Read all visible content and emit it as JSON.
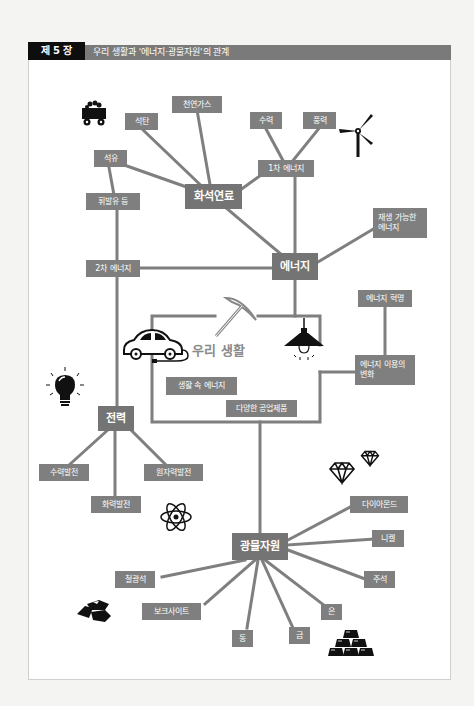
{
  "header": {
    "chapter": "제 5 장",
    "title": "우리 생활과 '에너지·광물자원'의 관계"
  },
  "colors": {
    "box": "#7f7f7f",
    "line": "#7f7f7f",
    "header_dark": "#0e0e0e",
    "header_gray": "#7a7a7a",
    "icon": "#111111"
  },
  "center": {
    "label": "우리 생활"
  },
  "nodes": {
    "energy": "에너지",
    "fossil_fuel": "화석연료",
    "primary_energy": "1차 에너지",
    "secondary_energy": "2차 에너지",
    "renewable_energy": "재생 가능한 에너지",
    "coal": "석탄",
    "natural_gas": "천연가스",
    "petroleum": "석유",
    "gasoline_etc": "휘발유 등",
    "hydro": "수력",
    "wind": "풍력",
    "energy_revolution": "에너지 혁명",
    "energy_use_change": "에너지 이용의 변화",
    "energy_in_life": "생활 속 에너지",
    "industrial_products": "다양한 공업제품",
    "electricity": "전력",
    "hydro_power": "수력발전",
    "thermal_power": "화력발전",
    "nuclear_power": "원자력발전",
    "mineral_resources": "광물자원",
    "diamond": "다이아몬드",
    "nickel": "니켈",
    "tin": "주석",
    "silver": "은",
    "gold": "금",
    "copper": "동",
    "bauxite": "보크사이트",
    "iron_ore": "철광석"
  },
  "icons": [
    "coal-cart-icon",
    "wind-turbine-icon",
    "pickaxe-icon",
    "electric-car-icon",
    "pendant-lamp-icon",
    "light-bulb-icon",
    "atom-icon",
    "diamond-icon",
    "ore-rocks-icon",
    "gold-bars-icon"
  ]
}
